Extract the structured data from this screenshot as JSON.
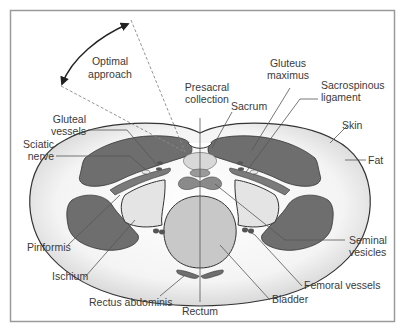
{
  "figure": {
    "colors": {
      "frame": "#9a9a9a",
      "skin_outline": "#333333",
      "fat": "#f2f2f2",
      "fat_edge": "#d0d0d0",
      "muscle": "#6e6e6e",
      "organ_light": "#c8c8c8",
      "bone_light": "#e4e4e4",
      "vessel": "#555555"
    },
    "approach": {
      "label_line1": "Optimal",
      "label_line2": "approach"
    },
    "labels": {
      "presacral_1": "Presacral",
      "presacral_2": "collection",
      "sacrum": "Sacrum",
      "gluteus_1": "Gluteus",
      "gluteus_2": "maximus",
      "sacrospinous_1": "Sacrospinous",
      "sacrospinous_2": "ligament",
      "skin": "Skin",
      "fat": "Fat",
      "gluteal_1": "Gluteal",
      "gluteal_2": "vessels",
      "sciatic_1": "Sciatic",
      "sciatic_2": "nerve",
      "piriformis": "Piriformis",
      "ischium": "Ischium",
      "rectus_abdominis": "Rectus abdominis",
      "rectum": "Rectum",
      "bladder": "Bladder",
      "femoral_vessels": "Femoral vessels",
      "seminal_1": "Seminal",
      "seminal_2": "vesicles"
    }
  }
}
